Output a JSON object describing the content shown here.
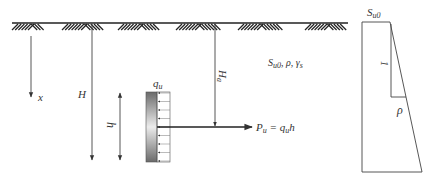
{
  "diagram": {
    "type": "soil-anchor-plate-pullout",
    "colors": {
      "line": "#444444",
      "text": "#333333",
      "plate_dark": "#6a6a6a",
      "plate_light": "#e8e8e8"
    },
    "labels": {
      "x_axis": "x",
      "depth_H": "H",
      "plate_height_h": "h",
      "load_q": "q",
      "load_q_sub": "u",
      "anchor_depth": "H",
      "anchor_depth_sub": "a",
      "soil_props": {
        "s": "S",
        "s_sub": "u0",
        "rest": ",  ρ, γ",
        "gamma_sub": "s"
      },
      "force": {
        "p": "P",
        "p_sub": "u",
        "eq": " = q",
        "q_sub": "u",
        "h": "h"
      },
      "profile": {
        "top": "S",
        "top_sub": "u0",
        "slope_vertical": "1",
        "slope_horizontal": "ρ"
      }
    },
    "load_arrow_count": 9
  }
}
